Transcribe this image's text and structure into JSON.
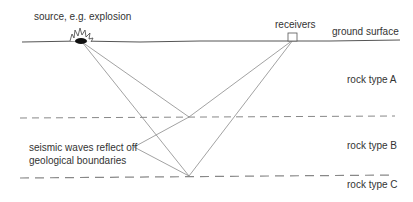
{
  "labels": {
    "source": "source, e.g. explosion",
    "receivers": "receivers",
    "ground_surface": "ground surface",
    "rock_a": "rock type A",
    "rock_b": "rock type B",
    "rock_c": "rock type C",
    "annotation_line1": "seismic waves reflect off",
    "annotation_line2": "geological boundaries"
  },
  "colors": {
    "line": "#555555",
    "ray": "#8a8a8a",
    "dashed": "#777777",
    "text": "#333333"
  }
}
